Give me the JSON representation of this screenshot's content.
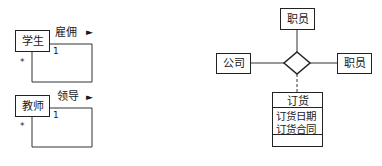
{
  "left_diagrams": [
    {
      "class_name": "学生",
      "association_name": "雇佣",
      "direction_arrow": "►",
      "multiplicity_source": "*",
      "multiplicity_target": "1"
    },
    {
      "class_name": "教师",
      "association_name": "领导",
      "direction_arrow": "►",
      "multiplicity_source": "*",
      "multiplicity_target": "1"
    }
  ],
  "right_diagram": {
    "top_class": "职员",
    "left_class": "公司",
    "right_class": "职员",
    "association_class": {
      "name": "订货",
      "attributes": [
        "订货日期",
        "订货合同"
      ],
      "operations": []
    }
  },
  "colors": {
    "line": "#222222",
    "background": "#ffffff"
  }
}
